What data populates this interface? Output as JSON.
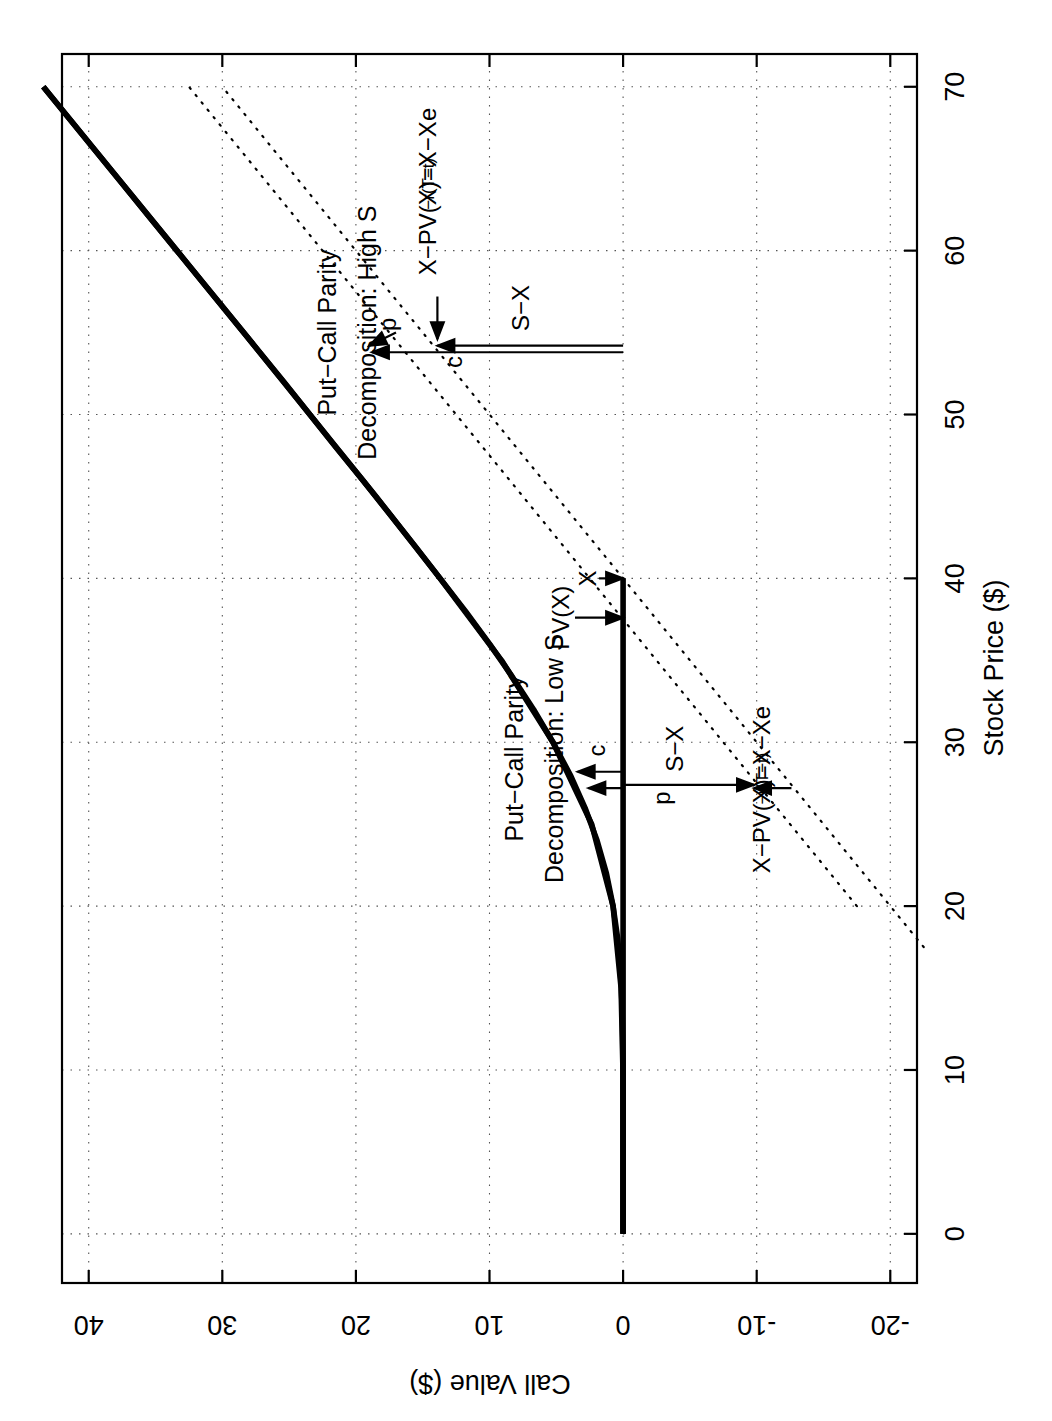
{
  "figure": {
    "rotation_note": "chart rendered rotated 90 degrees clockwise (landscape plot on portrait page)",
    "background": "#ffffff",
    "line_color": "#000000"
  },
  "chart_data": {
    "type": "line",
    "title": "",
    "xlabel": "Stock Price ($)",
    "ylabel": "Call Value ($)",
    "xlim": [
      -3,
      72
    ],
    "ylim": [
      -22,
      42
    ],
    "xticks": [
      0,
      10,
      20,
      30,
      40,
      50,
      60,
      70
    ],
    "xticklabels": [
      "0",
      "10",
      "20",
      "30",
      "40",
      "50",
      "60",
      "70"
    ],
    "yticks": [
      -20,
      -10,
      0,
      10,
      20,
      30,
      40
    ],
    "yticklabels": [
      "-20",
      "-10",
      "0",
      "10",
      "20",
      "30",
      "40"
    ],
    "grid": true,
    "grid_style": "dotted",
    "legend_position": "none",
    "parameters": {
      "strike_X": 40,
      "pv_X": 37.5,
      "r_times_T_minus_t": "X-PV(X)=X-Xe^-r(T-t)"
    },
    "series": [
      {
        "name": "Call value curve (Black-Scholes, c)",
        "style": "solid-thick",
        "x": [
          0,
          2,
          4,
          6,
          8,
          10,
          12,
          14,
          16,
          18,
          20,
          22,
          24,
          26,
          28,
          30,
          32,
          34,
          36,
          38,
          40,
          42,
          44,
          46,
          48,
          50,
          52,
          54,
          56,
          58,
          60,
          62,
          64,
          66,
          68,
          70
        ],
        "y": [
          0.0,
          0.0,
          0.0,
          0.0,
          0.0,
          0.01,
          0.03,
          0.08,
          0.2,
          0.4,
          0.75,
          1.25,
          1.95,
          2.85,
          3.95,
          5.25,
          6.7,
          8.3,
          10.0,
          11.8,
          13.7,
          15.6,
          17.55,
          19.5,
          21.5,
          23.45,
          25.4,
          27.4,
          29.4,
          31.4,
          33.4,
          35.4,
          37.4,
          39.4,
          41.4,
          43.4
        ]
      },
      {
        "name": "Put-call parity curve (c+X-PV(X), upper solid)",
        "style": "solid-thick",
        "x": [
          0,
          5,
          10,
          15,
          20,
          25,
          30,
          35,
          40,
          45,
          50,
          55,
          60,
          65,
          70
        ],
        "y": [
          0.0,
          0.0,
          0.01,
          0.15,
          0.75,
          2.35,
          5.25,
          9.1,
          13.7,
          18.5,
          23.45,
          28.4,
          33.4,
          38.4,
          43.4
        ]
      },
      {
        "name": "Intrinsic value S-X (dotted)",
        "style": "dotted",
        "x": [
          17.5,
          40,
          70
        ],
        "y": [
          -22.5,
          0,
          30
        ]
      },
      {
        "name": "S-PV(X) (dotted)",
        "style": "dotted",
        "x": [
          20,
          37.5,
          70
        ],
        "y": [
          -17.5,
          0,
          32.5
        ]
      }
    ],
    "annotations": [
      {
        "id": "label-high-s-line1",
        "text": "Put−Call Parity",
        "x": 55,
        "y": 22
      },
      {
        "id": "label-high-s-line2",
        "text": "Decomposition: High S",
        "x": 55,
        "y": 19
      },
      {
        "id": "label-low-s-line1",
        "text": "Put−Call Parity",
        "x": 29,
        "y": 8
      },
      {
        "id": "label-low-s-line2",
        "text": "Decomposition: Low S",
        "x": 29,
        "y": 5
      },
      {
        "id": "arrow-label-p-high",
        "text": "p",
        "x": 55.5,
        "y": 17.5
      },
      {
        "id": "arrow-label-c-high",
        "text": "c",
        "x": 53.2,
        "y": 12.5
      },
      {
        "id": "arrow-label-s-minus-x-high",
        "text": "S−X",
        "x": 56.5,
        "y": 7.5
      },
      {
        "id": "arrow-label-xpv-high-base",
        "text": "X−PV(X)=X−Xe",
        "x": 58.5,
        "y": 14.5
      },
      {
        "id": "arrow-label-xpv-high-sup",
        "text": "−r(T−t)",
        "x": 62.5,
        "y": 14.5
      },
      {
        "id": "arrow-label-c-low",
        "text": "c",
        "x": 29.5,
        "y": 1.8
      },
      {
        "id": "arrow-label-p-low",
        "text": "p",
        "x": 26.6,
        "y": -3.0
      },
      {
        "id": "arrow-label-s-minus-x-low",
        "text": "S−X",
        "x": 29.6,
        "y": -4.0
      },
      {
        "id": "arrow-label-xpv-low-base",
        "text": "X−PV(X)=X−Xe",
        "x": 22.0,
        "y": -10.5
      },
      {
        "id": "arrow-label-xpv-low-sup",
        "text": "−r(T−t)",
        "x": 26.2,
        "y": -10.5
      },
      {
        "id": "arrow-label-x",
        "text": "X",
        "x": 40.0,
        "y": 2.5
      },
      {
        "id": "arrow-label-pv-x",
        "text": "PV(X)",
        "x": 37.6,
        "y": 4.5
      }
    ],
    "arrows": [
      {
        "id": "arrow-p-high",
        "label": "p",
        "from": [
          55.0,
          17.0
        ],
        "to": [
          54.2,
          19.0
        ]
      },
      {
        "id": "arrow-xpv-high",
        "label": "X-PV(X)",
        "from": [
          57.2,
          13.9
        ],
        "to": [
          54.6,
          13.9
        ]
      },
      {
        "id": "arrow-s-minus-x-high",
        "label": "S-X",
        "from": [
          54.2,
          0.0
        ],
        "to": [
          54.2,
          13.9
        ]
      },
      {
        "id": "arrow-c-high",
        "label": "c",
        "from": [
          53.8,
          0.0
        ],
        "to": [
          53.8,
          18.8
        ]
      },
      {
        "id": "arrow-c-low",
        "label": "c",
        "from": [
          28.2,
          0.0
        ],
        "to": [
          28.2,
          3.4
        ]
      },
      {
        "id": "arrow-p-low",
        "label": "p",
        "from": [
          27.2,
          0.0
        ],
        "to": [
          27.2,
          2.6
        ]
      },
      {
        "id": "arrow-s-minus-x-low",
        "label": "S-X",
        "from": [
          27.4,
          0.0
        ],
        "to": [
          27.4,
          -9.8
        ]
      },
      {
        "id": "arrow-xpv-low",
        "label": "X-PV(X)",
        "from": [
          27.2,
          -12.6
        ],
        "to": [
          27.2,
          -9.8
        ]
      },
      {
        "id": "arrow-x",
        "label": "X",
        "from": [
          40.0,
          1.8
        ],
        "to": [
          40.0,
          0.0
        ]
      },
      {
        "id": "arrow-pv-x",
        "label": "PV(X)",
        "from": [
          37.6,
          3.6
        ],
        "to": [
          37.6,
          0.0
        ]
      }
    ]
  }
}
